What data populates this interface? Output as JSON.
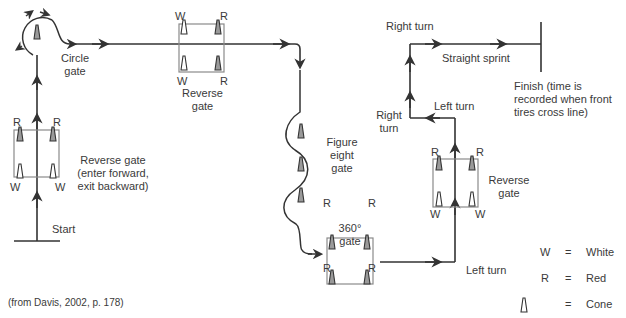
{
  "labels": {
    "circle_gate": [
      "Circle",
      "gate"
    ],
    "reverse_gate_1": [
      "Reverse gate",
      "(enter forward,",
      "exit backward)"
    ],
    "start": "Start",
    "reverse_gate_2": [
      "Reverse",
      "gate"
    ],
    "figure_eight": [
      "Figure",
      "eight",
      "gate"
    ],
    "gate_360": [
      "360°",
      "gate"
    ],
    "left_turn_bottom": "Left turn",
    "reverse_gate_3": [
      "Reverse",
      "gate"
    ],
    "left_turn_top": "Left turn",
    "right_turn_mid": [
      "Right",
      "turn"
    ],
    "right_turn_top": "Right turn",
    "straight_sprint": "Straight sprint",
    "finish": [
      "Finish (time is",
      "recorded when front",
      "tires cross line)"
    ],
    "citation": "(from Davis, 2002, p. 178)"
  },
  "cone_letters": {
    "W": "W",
    "R": "R"
  },
  "legend": [
    {
      "symbol": "W",
      "eq": "=",
      "meaning": "White"
    },
    {
      "symbol": "R",
      "eq": "=",
      "meaning": "Red"
    },
    {
      "symbol": "cone-icon",
      "eq": "=",
      "meaning": "Cone"
    }
  ],
  "colors": {
    "line": "#333333",
    "box": "#8a8a8a",
    "red_cone": "#9a9a9a",
    "white_cone": "#ffffff"
  }
}
